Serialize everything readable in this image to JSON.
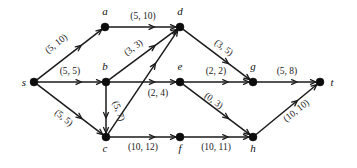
{
  "diagram": {
    "type": "directed-graph",
    "background_color": "#ffffff",
    "node_color": "#0d0d0d",
    "edge_color": "#1a1a1a",
    "width": 357,
    "height": 168
  },
  "nodes": [
    {
      "id": "s",
      "label": "s",
      "x": 34,
      "y": 82,
      "label_x": 24,
      "label_y": 86
    },
    {
      "id": "a",
      "label": "a",
      "x": 105,
      "y": 27,
      "label_x": 105,
      "label_y": 15
    },
    {
      "id": "b",
      "label": "b",
      "x": 106,
      "y": 82,
      "label_x": 105,
      "label_y": 70
    },
    {
      "id": "c",
      "label": "c",
      "x": 106,
      "y": 137,
      "label_x": 105,
      "label_y": 152
    },
    {
      "id": "d",
      "label": "d",
      "x": 180,
      "y": 27,
      "label_x": 180,
      "label_y": 15
    },
    {
      "id": "e",
      "label": "e",
      "x": 180,
      "y": 82,
      "label_x": 180,
      "label_y": 70
    },
    {
      "id": "f",
      "label": "f",
      "x": 180,
      "y": 137,
      "label_x": 180,
      "label_y": 152
    },
    {
      "id": "g",
      "label": "g",
      "x": 253,
      "y": 82,
      "label_x": 253,
      "label_y": 70
    },
    {
      "id": "h",
      "label": "h",
      "x": 253,
      "y": 137,
      "label_x": 253,
      "label_y": 152
    },
    {
      "id": "t",
      "label": "t",
      "x": 320,
      "y": 82,
      "label_x": 332,
      "label_y": 86
    }
  ],
  "edges": [
    {
      "from": "s",
      "to": "a",
      "label": "(5, 10)",
      "label_x": 58,
      "label_y": 46,
      "rotate": -38
    },
    {
      "from": "s",
      "to": "b",
      "label": "(5, 5)",
      "label_x": 70,
      "label_y": 74,
      "rotate": 0
    },
    {
      "from": "s",
      "to": "c",
      "label": "(5, 5)",
      "label_x": 62,
      "label_y": 120,
      "rotate": 38
    },
    {
      "from": "a",
      "to": "d",
      "label": "(5, 10)",
      "label_x": 143,
      "label_y": 19,
      "rotate": 0
    },
    {
      "from": "b",
      "to": "d",
      "label": "(3, 3)",
      "label_x": 135,
      "label_y": 50,
      "rotate": -36
    },
    {
      "from": "b",
      "to": "c",
      "label": "(5, 7)",
      "label_x": 116,
      "label_y": 112,
      "rotate": 70
    },
    {
      "from": "b",
      "to": "e",
      "label": "(2, 4)",
      "label_x": 158,
      "label_y": 96,
      "rotate": 0
    },
    {
      "from": "c",
      "to": "d",
      "label": "",
      "label_x": 0,
      "label_y": 0,
      "rotate": 0
    },
    {
      "from": "c",
      "to": "f",
      "label": "(10, 12)",
      "label_x": 143,
      "label_y": 150,
      "rotate": 0
    },
    {
      "from": "d",
      "to": "g",
      "label": "(3, 5)",
      "label_x": 222,
      "label_y": 50,
      "rotate": 36
    },
    {
      "from": "e",
      "to": "g",
      "label": "(2, 2)",
      "label_x": 216,
      "label_y": 74,
      "rotate": 0
    },
    {
      "from": "e",
      "to": "h",
      "label": "(0, 3)",
      "label_x": 212,
      "label_y": 103,
      "rotate": 36
    },
    {
      "from": "f",
      "to": "h",
      "label": "(10, 11)",
      "label_x": 216,
      "label_y": 150,
      "rotate": 0
    },
    {
      "from": "g",
      "to": "t",
      "label": "(5, 8)",
      "label_x": 287,
      "label_y": 74,
      "rotate": 0
    },
    {
      "from": "h",
      "to": "t",
      "label": "(10, 10)",
      "label_x": 298,
      "label_y": 113,
      "rotate": -38
    }
  ]
}
